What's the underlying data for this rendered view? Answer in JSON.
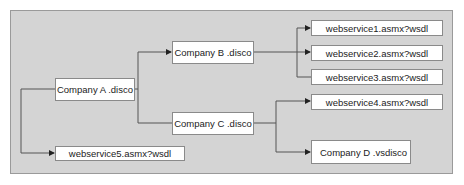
{
  "diagram": {
    "type": "discovery-hierarchy",
    "colors": {
      "panel": "#d4d4d4",
      "panel_border": "#9a9a9a",
      "node_bg": "#ffffff",
      "line": "#555555"
    },
    "nodes": {
      "company_a": "Company A .disco",
      "company_b": "Company B .disco",
      "company_c": "Company C .disco",
      "company_d": "Company D .vsdisco",
      "ws1": "webservice1.asmx?wsdl",
      "ws2": "webservice2.asmx?wsdl",
      "ws3": "webservice3.asmx?wsdl",
      "ws4": "webservice4.asmx?wsdl",
      "ws5": "webservice5.asmx?wsdl"
    },
    "edges": [
      {
        "from": "company_a",
        "to": "company_b"
      },
      {
        "from": "company_a",
        "to": "company_c"
      },
      {
        "from": "company_a",
        "to": "ws5"
      },
      {
        "from": "company_b",
        "to": "ws1"
      },
      {
        "from": "company_b",
        "to": "ws2"
      },
      {
        "from": "company_b",
        "to": "ws3"
      },
      {
        "from": "company_c",
        "to": "ws4"
      },
      {
        "from": "company_c",
        "to": "company_d"
      }
    ]
  }
}
